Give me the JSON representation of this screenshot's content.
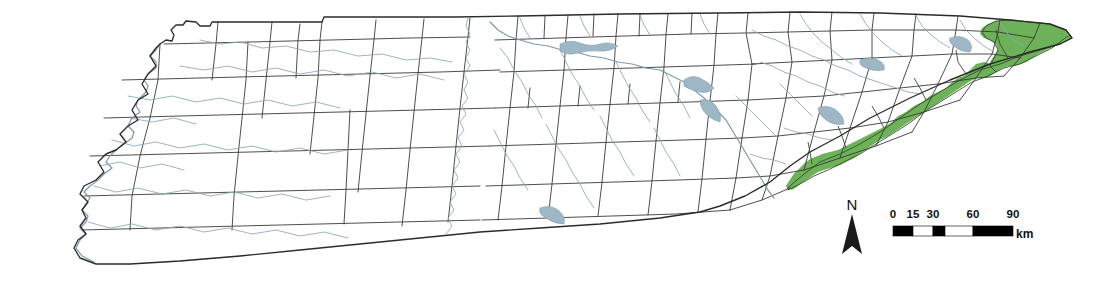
{
  "map": {
    "title": "Tennessee county map with highlighted eastern counties",
    "region_name": "Tennessee",
    "background_color": "#ffffff",
    "county_line_color": "#3a3a38",
    "state_line_color": "#2b2b29",
    "river_color": "#8aa6b8",
    "highlight_color": "#6db259",
    "highlight_outline_color": "#2f4f2c",
    "highlight_description": "Eastern Tennessee Blue Ridge / Unaka mountain counties shaded green"
  },
  "north_arrow": {
    "label": "N",
    "name": "north-arrow"
  },
  "scale_bar": {
    "unit_label": "km",
    "tick_labels": [
      "0",
      "15",
      "30",
      "60",
      "90"
    ],
    "tick_values": [
      0,
      15,
      30,
      60,
      90
    ],
    "max_value": 90,
    "segments": [
      {
        "from": 0,
        "to": 15,
        "color": "#000000"
      },
      {
        "from": 15,
        "to": 30,
        "color": "#ffffff"
      },
      {
        "from": 30,
        "to": 60,
        "color": "#000000"
      },
      {
        "from": 60,
        "to": 90,
        "color": "#000000"
      }
    ]
  }
}
